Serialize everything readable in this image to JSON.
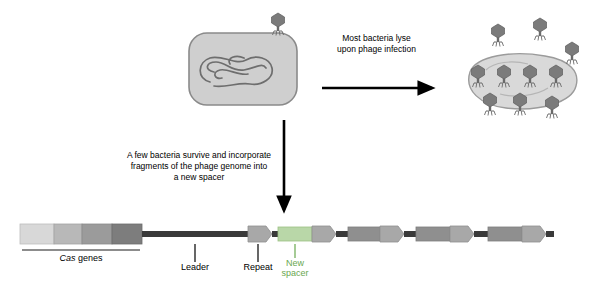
{
  "diagram": {
    "callouts": [
      {
        "id": "lyse",
        "line1": "Most bacteria lyse",
        "line2": "upon phage infection"
      },
      {
        "id": "survive",
        "line1": "A few bacteria survive and incorporate",
        "line2": "fragments of the phage genome into",
        "line3": "a new spacer"
      }
    ],
    "labels": {
      "cas_genes_italic": "Cas",
      "cas_genes_rest": " genes",
      "leader": "Leader",
      "repeat": "Repeat",
      "new_spacer_line1": "New",
      "new_spacer_line2": "spacer"
    },
    "colors": {
      "phage_head": "#7b7b7b",
      "phage_dark": "#5a5a5a",
      "bacterium_fill": "#cfcfcf",
      "bacterium_outline": "#8a8a8a",
      "dna_stroke": "#6e6e6e",
      "lysed_cell": "#d9d9d9",
      "arrow_black": "#000000",
      "cas_light": "#d8d8d8",
      "cas_mid": "#b0b0b0",
      "cas_dark": "#8a8a8a",
      "cas_darkest": "#6a6a6a",
      "spacer_grey": "#8f8f8f",
      "spacer_new": "#b9d7a8",
      "new_spacer_text": "#6aa84f",
      "locus_line": "#3a3a3a",
      "tick": "#000000"
    }
  }
}
